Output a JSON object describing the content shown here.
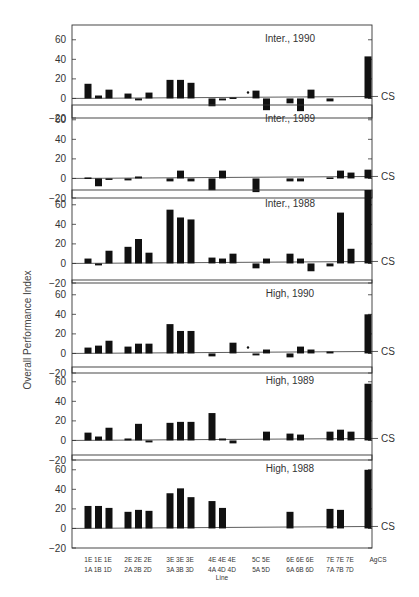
{
  "chart_data": {
    "type": "bar",
    "title": "",
    "ylabel": "Overall Performance Index",
    "xlabel": "Line",
    "ylim": [
      -20,
      70
    ],
    "yticks": [
      -20,
      0,
      20,
      40,
      60
    ],
    "reference_line_label": "CS",
    "categories": [
      "1E/1A",
      "1E/1B",
      "1E/1D",
      "2E/2A",
      "2E/2B",
      "2E/2D",
      "3E/3A",
      "3E/3B",
      "3E/3D",
      "4E/4A",
      "4E/4D",
      "4E/4D",
      "5C/5A",
      "5E/5D",
      "6E/6A",
      "6E/6B",
      "6E/6D",
      "7E/7A",
      "7E/7B",
      "7E/7D",
      "AgCS"
    ],
    "x_group_labels_top": [
      "1E 1E 1E",
      "2E 2E 2E",
      "3E 3E 3E",
      "4E 4E 4E",
      "5C 5E",
      "6E 6E 6E",
      "7E 7E 7E",
      "AgCS"
    ],
    "x_group_labels_bottom": [
      "1A 1B 1D",
      "2A 2B 2D",
      "3A 3B 3D",
      "4A 4D 4D",
      "5A 5D",
      "6A 6B 6D",
      "7A 7B 7D",
      ""
    ],
    "x_axis_title": "Line",
    "panels": [
      {
        "name": "Inter., 1990",
        "values": [
          15,
          3,
          9,
          5,
          -2,
          6,
          19,
          19,
          16,
          -8,
          -2,
          1,
          8,
          -12,
          -5,
          -13,
          9,
          -3,
          43
        ],
        "marker_at": "5C"
      },
      {
        "name": "Inter., 1989",
        "values": [
          1,
          -8,
          -1,
          -2,
          2,
          0,
          -3,
          8,
          -3,
          -12,
          8,
          0,
          -14,
          0,
          -3,
          -3,
          0,
          1,
          8,
          6,
          9
        ]
      },
      {
        "name": "Inter., 1988",
        "values": [
          5,
          -2,
          13,
          17,
          25,
          11,
          55,
          47,
          45,
          6,
          5,
          10,
          -5,
          5,
          10,
          5,
          -8,
          -3,
          52,
          15,
          75
        ]
      },
      {
        "name": "High, 1990",
        "values": [
          6,
          8,
          13,
          7,
          10,
          10,
          30,
          23,
          23,
          -3,
          0,
          11,
          -2,
          4,
          -4,
          7,
          4,
          2,
          40
        ],
        "marker_at": "5C"
      },
      {
        "name": "High, 1989",
        "values": [
          8,
          4,
          13,
          2,
          17,
          -2,
          18,
          19,
          19,
          28,
          2,
          -3,
          0,
          9,
          7,
          6,
          0,
          9,
          11,
          9,
          58
        ]
      },
      {
        "name": "High, 1988",
        "values": [
          23,
          23,
          21,
          17,
          19,
          18,
          36,
          41,
          32,
          28,
          21,
          0,
          0,
          0,
          17,
          0,
          0,
          20,
          19,
          0,
          60
        ]
      }
    ]
  },
  "figure": {
    "y_axis_title": "Overall Performance Index",
    "cs_label": "CS",
    "x_axis_title": "Line",
    "panel_titles": [
      "Inter., 1990",
      "Inter., 1989",
      "Inter., 1988",
      "High, 1990",
      "High, 1989",
      "High, 1988"
    ],
    "ytick_labels": [
      "60",
      "40",
      "20",
      "0",
      "-20"
    ]
  }
}
